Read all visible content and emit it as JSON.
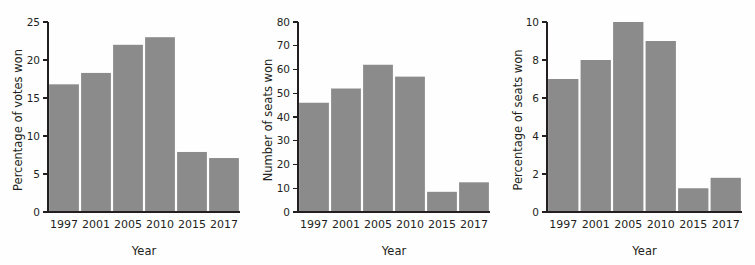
{
  "figure": {
    "background_color": "#fefefe",
    "bar_color": "#8b8b8b",
    "axis_color": "#231f20",
    "panel_count": 3
  },
  "chart_data": [
    {
      "type": "bar",
      "title": "",
      "xlabel": "Year",
      "ylabel": "Percentage of votes won",
      "categories": [
        "1997",
        "2001",
        "2005",
        "2010",
        "2015",
        "2017"
      ],
      "values": [
        16.8,
        18.3,
        22.0,
        23.0,
        7.9,
        7.1
      ],
      "ylim": [
        0,
        25
      ],
      "yticks": [
        0,
        5,
        10,
        15,
        20,
        25
      ],
      "ytick_labels": [
        "0",
        "5",
        "10",
        "15",
        "20",
        "25"
      ],
      "grid": false,
      "legend": "none",
      "series": [
        {
          "name": "Percentage of votes won",
          "values": [
            16.8,
            18.3,
            22.0,
            23.0,
            7.9,
            7.1
          ]
        }
      ]
    },
    {
      "type": "bar",
      "title": "",
      "xlabel": "Year",
      "ylabel": "Number of seats won",
      "categories": [
        "1997",
        "2001",
        "2005",
        "2010",
        "2015",
        "2017"
      ],
      "values": [
        46,
        52,
        62,
        57,
        8.5,
        12.5
      ],
      "ylim": [
        0,
        80
      ],
      "yticks": [
        0,
        10,
        20,
        30,
        40,
        50,
        60,
        70,
        80
      ],
      "ytick_labels": [
        "0",
        "10",
        "20",
        "30",
        "40",
        "50",
        "60",
        "70",
        "80"
      ],
      "grid": false,
      "legend": "none",
      "series": [
        {
          "name": "Number of seats won",
          "values": [
            46,
            52,
            62,
            57,
            8.5,
            12.5
          ]
        }
      ]
    },
    {
      "type": "bar",
      "title": "",
      "xlabel": "Year",
      "ylabel": "Percentage of seats won",
      "categories": [
        "1997",
        "2001",
        "2005",
        "2010",
        "2015",
        "2017"
      ],
      "values": [
        7.0,
        8.0,
        10.0,
        9.0,
        1.25,
        1.8
      ],
      "ylim": [
        0,
        10
      ],
      "yticks": [
        0,
        2,
        4,
        6,
        8,
        10
      ],
      "ytick_labels": [
        "0",
        "2",
        "4",
        "6",
        "8",
        "10"
      ],
      "grid": false,
      "legend": "none",
      "series": [
        {
          "name": "Percentage of seats won",
          "values": [
            7.0,
            8.0,
            10.0,
            9.0,
            1.25,
            1.8
          ]
        }
      ]
    }
  ]
}
